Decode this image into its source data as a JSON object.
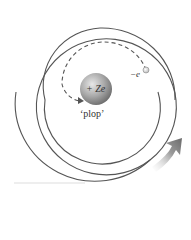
{
  "diagram": {
    "nucleus": {
      "label": "+ Ze",
      "color": "#8a8a8a"
    },
    "electron": {
      "label": "−e",
      "color": "#d8d8d8"
    },
    "sound_label": "‘plop’",
    "colors": {
      "spiral": "#555555",
      "dashed_path": "#555555",
      "arrow": "#6e6e6e",
      "background": "#ffffff"
    },
    "icons": {
      "direction_arrow": "curved-arrow-up-right-icon"
    }
  }
}
